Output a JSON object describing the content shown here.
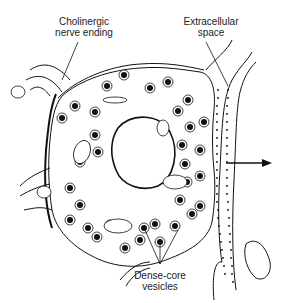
{
  "figure": {
    "labels": {
      "cholinergic_line1": "Cholinergic",
      "cholinergic_line2": "nerve ending",
      "extracellular_line1": "Extracellular",
      "extracellular_line2": "space",
      "vesicles_line1": "Dense-core",
      "vesicles_line2": "vesicles"
    },
    "colors": {
      "ink": "#111111",
      "background": "#ffffff"
    }
  }
}
